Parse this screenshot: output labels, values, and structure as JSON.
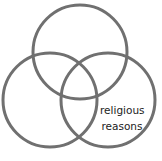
{
  "diagram": {
    "type": "venn",
    "stroke_color": "#707070",
    "circles": [
      {
        "name": "top",
        "cx": 80,
        "cy": 52,
        "r": 47
      },
      {
        "name": "left",
        "cx": 50,
        "cy": 100,
        "r": 47
      },
      {
        "name": "right",
        "cx": 108,
        "cy": 100,
        "r": 47
      }
    ],
    "labels": {
      "right_line1": "religious",
      "right_line2": "reasons"
    }
  }
}
